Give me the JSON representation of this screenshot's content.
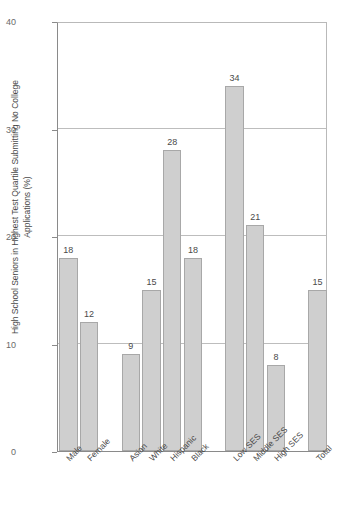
{
  "chart_data": {
    "type": "bar",
    "title": "",
    "xlabel": "",
    "ylabel": "High School Seniors in Highest Test Quartile Submitting No College Applications (%)",
    "ylim": [
      0,
      40
    ],
    "yticks": [
      0,
      10,
      20,
      30,
      40
    ],
    "ytick_labels": [
      "0",
      "10",
      "20",
      "30",
      "40"
    ],
    "grid": "horizontal",
    "legend": "none",
    "categories": [
      "Male",
      "Female",
      "Asian",
      "White",
      "Hispanic",
      "Black",
      "Low SES",
      "Middle SES",
      "High SES",
      "Total"
    ],
    "values": [
      18,
      12,
      9,
      15,
      28,
      18,
      34,
      21,
      8,
      15
    ],
    "value_labels": [
      "18",
      "12",
      "9",
      "15",
      "28",
      "18",
      "34",
      "21",
      "8",
      "15"
    ],
    "groups": [
      {
        "name": "Gender",
        "categories": [
          "Male",
          "Female"
        ]
      },
      {
        "name": "Race/Ethnicity",
        "categories": [
          "Asian",
          "White",
          "Hispanic",
          "Black"
        ]
      },
      {
        "name": "Socioeconomic Status",
        "categories": [
          "Low SES",
          "Middle SES",
          "High SES"
        ]
      },
      {
        "name": "All",
        "categories": [
          "Total"
        ]
      }
    ],
    "bar_fill_color": "#cfcfcf",
    "bar_border_color": "#a8a8a8",
    "grid_color": "#bdbdbd",
    "axis_color": "#8a8a8a",
    "background_color": "#ffffff",
    "text_color": "#4a4a4a"
  }
}
